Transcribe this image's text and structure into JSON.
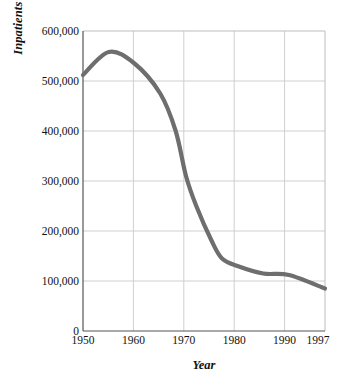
{
  "chart_data": {
    "type": "line",
    "title": "",
    "xlabel": "Year",
    "ylabel": "Inpatients in Public Mental Hospitals",
    "xlim": [
      1950,
      1997
    ],
    "ylim": [
      0,
      600000
    ],
    "grid": true,
    "legend": "none",
    "line_color": "#6e6e6e",
    "axis_color": "#3a3a3a",
    "grid_color": "#cfcfcf",
    "x_ticks": [
      "1950",
      "1960",
      "1970",
      "1980",
      "1990",
      "1997"
    ],
    "x_tick_values": [
      1950,
      1960,
      1970,
      1980,
      1990,
      1997
    ],
    "y_ticks": [
      "0",
      "100,000",
      "200,000",
      "300,000",
      "400,000",
      "500,000",
      "600,000"
    ],
    "y_tick_values": [
      0,
      100000,
      200000,
      300000,
      400000,
      500000,
      600000
    ],
    "series": [
      {
        "name": "Inpatients in Public Mental Hospitals",
        "x": [
          1950,
          1955,
          1960,
          1965,
          1968,
          1970,
          1972,
          1975,
          1977,
          1980,
          1985,
          1990,
          1997
        ],
        "values": [
          512000,
          558000,
          535000,
          475000,
          400000,
          310000,
          250000,
          180000,
          145000,
          130000,
          115000,
          112000,
          85000
        ]
      }
    ]
  },
  "axis": {
    "y_title": "Inpatients in Public Mental Hospitals",
    "x_title": "Year"
  }
}
